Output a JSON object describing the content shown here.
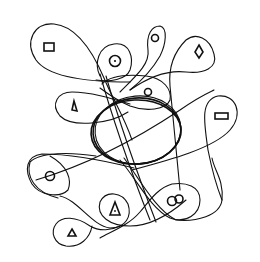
{
  "figure": {
    "title": "Hand-drawn loop diagram",
    "stroke_color": "#111111",
    "background": "#ffffff"
  },
  "center": {
    "label": "central ellipse",
    "shape": "ellipse",
    "cx": 137,
    "cy": 130,
    "rx": 44,
    "ry": 33
  },
  "loops": [
    {
      "id": "loop-top-left",
      "contains": "rectangle"
    },
    {
      "id": "loop-circle-dot",
      "contains": "circle-with-dot"
    },
    {
      "id": "loop-top-small-circle",
      "contains": "small-circle"
    },
    {
      "id": "loop-diamond",
      "contains": "diamond"
    },
    {
      "id": "loop-inner-circle",
      "contains": "small-circle"
    },
    {
      "id": "loop-triangle-upper",
      "contains": "triangle"
    },
    {
      "id": "loop-right-rectangle",
      "contains": "rectangle"
    },
    {
      "id": "loop-left-circle",
      "contains": "small-circle"
    },
    {
      "id": "loop-triangle-dot",
      "contains": "triangle-with-dot"
    },
    {
      "id": "loop-double-circle",
      "contains": "double-circle"
    },
    {
      "id": "loop-bottom-triangle",
      "contains": "triangle"
    }
  ],
  "symbols": [
    {
      "name": "rectangle",
      "x": 44,
      "y": 42,
      "w": 10,
      "h": 8
    },
    {
      "name": "circle-with-dot",
      "cx": 115,
      "cy": 60,
      "r": 6
    },
    {
      "name": "small-circle-top",
      "cx": 155,
      "cy": 38,
      "r": 4
    },
    {
      "name": "diamond",
      "cx": 199,
      "cy": 51
    },
    {
      "name": "small-circle-inner",
      "cx": 148,
      "cy": 92,
      "r": 4
    },
    {
      "name": "triangle-upper",
      "cx": 75,
      "cy": 106
    },
    {
      "name": "rectangle-right",
      "x": 215,
      "y": 113,
      "w": 13,
      "h": 6
    },
    {
      "name": "circle-left",
      "cx": 50,
      "cy": 176,
      "r": 5
    },
    {
      "name": "triangle-with-dot",
      "cx": 115,
      "cy": 210
    },
    {
      "name": "double-circle",
      "cx": 176,
      "cy": 200
    },
    {
      "name": "triangle-bottom",
      "cx": 72,
      "cy": 233
    }
  ]
}
